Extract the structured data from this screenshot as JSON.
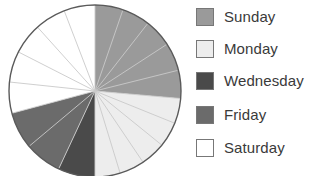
{
  "chart_data": {
    "type": "pie",
    "title": "",
    "categories": [
      "Sunday",
      "Monday",
      "Wednesday",
      "Friday",
      "Saturday"
    ],
    "values": [
      95,
      85,
      25,
      50,
      105
    ],
    "unit": "degrees",
    "legend_position": "right",
    "grid": false,
    "start_angle_deg": 270,
    "direction": "clockwise",
    "colors": {
      "Sunday": "#9a9a9a",
      "Monday": "#ededed",
      "Wednesday": "#4a4a4a",
      "Friday": "#6b6b6b",
      "Saturday": "#ffffff"
    },
    "slices": [
      {
        "label": "Sunday",
        "color": "#9a9a9a",
        "start_deg": 270,
        "end_deg": 365,
        "sweep_deg": 95,
        "subdivisions": 5
      },
      {
        "label": "Monday",
        "color": "#ededed",
        "start_deg": 365,
        "end_deg": 450,
        "sweep_deg": 85,
        "subdivisions": 5
      },
      {
        "label": "Wednesday",
        "color": "#4a4a4a",
        "start_deg": 450,
        "end_deg": 475,
        "sweep_deg": 25,
        "subdivisions": 1
      },
      {
        "label": "Friday",
        "color": "#6b6b6b",
        "start_deg": 475,
        "end_deg": 525,
        "sweep_deg": 50,
        "subdivisions": 2
      },
      {
        "label": "Saturday",
        "color": "#ffffff",
        "start_deg": 525,
        "end_deg": 630,
        "sweep_deg": 105,
        "subdivisions": 5
      }
    ],
    "geometry": {
      "center_x": 95,
      "center_y": 91,
      "radius": 86,
      "outline_color": "#5a5a5a",
      "divider_color": "#c9c9c9"
    }
  },
  "legend": {
    "items": [
      {
        "label": "Sunday",
        "swatch_color": "#9a9a9a",
        "y": 12
      },
      {
        "label": "Monday",
        "swatch_color": "#ededed",
        "y": 44
      },
      {
        "label": "Wednesday",
        "swatch_color": "#4a4a4a",
        "y": 76
      },
      {
        "label": "Friday",
        "swatch_color": "#6b6b6b",
        "y": 110
      },
      {
        "label": "Saturday",
        "swatch_color": "#ffffff",
        "y": 143
      }
    ]
  }
}
